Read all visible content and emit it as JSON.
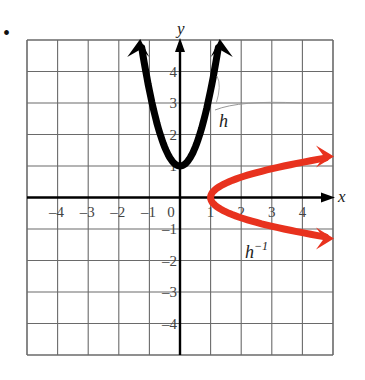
{
  "problem_marker": "•",
  "chart_data": {
    "type": "line",
    "title": "",
    "xlabel": "x",
    "ylabel": "y",
    "xlim": [
      -5,
      5
    ],
    "ylim": [
      -5,
      5
    ],
    "grid": true,
    "x_ticks": [
      "-4",
      "-3",
      "-2",
      "-1",
      "0",
      "1",
      "2",
      "3",
      "4"
    ],
    "y_ticks": [
      "4",
      "3",
      "2",
      "1",
      "-1",
      "-2",
      "-3",
      "-4"
    ],
    "series": [
      {
        "name": "h",
        "label": "h",
        "color": "#000000",
        "description": "upward parabola, vertex (0,1), arrows at top",
        "points": [
          [
            -1.3,
            5
          ],
          [
            -1,
            3
          ],
          [
            -0.5,
            1.5
          ],
          [
            0,
            1
          ],
          [
            0.5,
            1.5
          ],
          [
            1,
            3
          ],
          [
            1.3,
            5
          ]
        ]
      },
      {
        "name": "h_inverse",
        "label": "h⁻¹",
        "color": "#e8321e",
        "description": "sideways parabola opening right, vertex (1,0), arrows at right",
        "points": [
          [
            5,
            1.3
          ],
          [
            3,
            1
          ],
          [
            1.5,
            0.5
          ],
          [
            1,
            0
          ],
          [
            1.5,
            -0.5
          ],
          [
            3,
            -1
          ],
          [
            5,
            -1.3
          ]
        ]
      }
    ]
  },
  "labels": {
    "x_axis": "x",
    "y_axis": "y",
    "h": "h",
    "h_inv_base": "h",
    "h_inv_sup": "−1"
  }
}
